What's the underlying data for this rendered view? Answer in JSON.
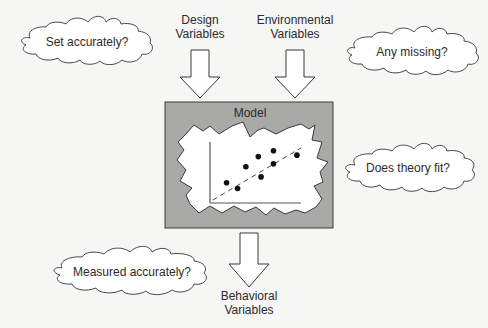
{
  "diagram": {
    "inputs": {
      "design": {
        "line1": "Design",
        "line2": "Variables"
      },
      "environmental": {
        "line1": "Environmental",
        "line2": "Variables"
      }
    },
    "model": {
      "title": "Model",
      "scatter_points": [
        [
          1.2,
          1.4
        ],
        [
          2.0,
          1.0
        ],
        [
          2.6,
          2.5
        ],
        [
          3.5,
          3.2
        ],
        [
          3.7,
          1.8
        ],
        [
          4.6,
          3.6
        ],
        [
          4.6,
          2.7
        ],
        [
          6.3,
          3.3
        ]
      ],
      "trend_line": {
        "from": [
          0.2,
          0.2
        ],
        "to": [
          6.6,
          3.8
        ],
        "style": "dashed"
      }
    },
    "output": {
      "line1": "Behavioral",
      "line2": "Variables"
    },
    "questions": {
      "set_accurately": "Set accurately?",
      "any_missing": "Any missing?",
      "theory_fit": "Does theory fit?",
      "measured_accurately": "Measured accurately?"
    },
    "colors": {
      "background": "#f6f6f4",
      "model_box": "#a9a9a7",
      "stroke": "#3a3a3a",
      "region": "#ffffff"
    }
  }
}
